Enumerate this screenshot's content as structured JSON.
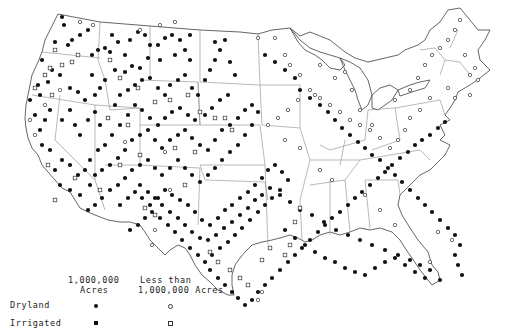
{
  "map": {
    "title": "",
    "region": "Contiguous United States",
    "colors": {
      "outline": "#555555",
      "state_line": "#8a8a8a",
      "marker": "#111111",
      "background": "#ffffff"
    }
  },
  "legend": {
    "col1_header_line1": "1,000,000",
    "col1_header_line2": "Acres",
    "col2_header_line1": "Less than",
    "col2_header_line2": "1,000,000 Acres",
    "rows": [
      {
        "label": "Dryland",
        "large_symbol": "filled-circle",
        "small_symbol": "open-circle"
      },
      {
        "label": "Irrigated",
        "large_symbol": "filled-square",
        "small_symbol": "open-square"
      }
    ]
  },
  "markers": {
    "dryland_large": [
      [
        62,
        17
      ],
      [
        64,
        25
      ],
      [
        80,
        35
      ],
      [
        88,
        30
      ],
      [
        55,
        42
      ],
      [
        68,
        45
      ],
      [
        72,
        40
      ],
      [
        98,
        50
      ],
      [
        105,
        48
      ],
      [
        92,
        55
      ],
      [
        110,
        52
      ],
      [
        118,
        42
      ],
      [
        125,
        55
      ],
      [
        112,
        35
      ],
      [
        130,
        40
      ],
      [
        138,
        32
      ],
      [
        145,
        35
      ],
      [
        150,
        45
      ],
      [
        158,
        45
      ],
      [
        165,
        38
      ],
      [
        172,
        35
      ],
      [
        180,
        40
      ],
      [
        190,
        35
      ],
      [
        185,
        50
      ],
      [
        175,
        55
      ],
      [
        190,
        60
      ],
      [
        160,
        60
      ],
      [
        148,
        58
      ],
      [
        140,
        68
      ],
      [
        132,
        66
      ],
      [
        125,
        72
      ],
      [
        115,
        70
      ],
      [
        105,
        80
      ],
      [
        100,
        88
      ],
      [
        92,
        75
      ],
      [
        95,
        95
      ],
      [
        85,
        100
      ],
      [
        78,
        92
      ],
      [
        70,
        88
      ],
      [
        60,
        75
      ],
      [
        52,
        70
      ],
      [
        48,
        82
      ],
      [
        42,
        60
      ],
      [
        38,
        85
      ],
      [
        40,
        95
      ],
      [
        30,
        100
      ],
      [
        50,
        110
      ],
      [
        45,
        120
      ],
      [
        40,
        130
      ],
      [
        35,
        115
      ],
      [
        42,
        145
      ],
      [
        50,
        150
      ],
      [
        62,
        120
      ],
      [
        70,
        110
      ],
      [
        75,
        125
      ],
      [
        80,
        135
      ],
      [
        88,
        120
      ],
      [
        95,
        112
      ],
      [
        100,
        125
      ],
      [
        108,
        118
      ],
      [
        115,
        105
      ],
      [
        120,
        95
      ],
      [
        128,
        90
      ],
      [
        135,
        85
      ],
      [
        142,
        80
      ],
      [
        150,
        78
      ],
      [
        158,
        88
      ],
      [
        165,
        95
      ],
      [
        170,
        85
      ],
      [
        178,
        80
      ],
      [
        185,
        75
      ],
      [
        192,
        88
      ],
      [
        198,
        95
      ],
      [
        205,
        80
      ],
      [
        210,
        70
      ],
      [
        215,
        60
      ],
      [
        220,
        50
      ],
      [
        225,
        40
      ],
      [
        215,
        42
      ],
      [
        230,
        62
      ],
      [
        235,
        75
      ],
      [
        228,
        95
      ],
      [
        220,
        100
      ],
      [
        212,
        108
      ],
      [
        205,
        115
      ],
      [
        195,
        120
      ],
      [
        188,
        115
      ],
      [
        180,
        108
      ],
      [
        172,
        112
      ],
      [
        165,
        118
      ],
      [
        158,
        125
      ],
      [
        150,
        118
      ],
      [
        142,
        110
      ],
      [
        135,
        105
      ],
      [
        128,
        115
      ],
      [
        120,
        125
      ],
      [
        112,
        135
      ],
      [
        105,
        145
      ],
      [
        98,
        150
      ],
      [
        90,
        160
      ],
      [
        85,
        170
      ],
      [
        78,
        175
      ],
      [
        70,
        165
      ],
      [
        62,
        160
      ],
      [
        55,
        170
      ],
      [
        60,
        185
      ],
      [
        70,
        190
      ],
      [
        80,
        195
      ],
      [
        90,
        185
      ],
      [
        95,
        175
      ],
      [
        102,
        170
      ],
      [
        110,
        165
      ],
      [
        118,
        158
      ],
      [
        125,
        150
      ],
      [
        132,
        140
      ],
      [
        140,
        135
      ],
      [
        148,
        130
      ],
      [
        155,
        140
      ],
      [
        162,
        148
      ],
      [
        170,
        140
      ],
      [
        178,
        135
      ],
      [
        185,
        130
      ],
      [
        192,
        138
      ],
      [
        200,
        145
      ],
      [
        208,
        150
      ],
      [
        215,
        140
      ],
      [
        222,
        130
      ],
      [
        230,
        125
      ],
      [
        238,
        118
      ],
      [
        245,
        110
      ],
      [
        252,
        105
      ],
      [
        258,
        112
      ],
      [
        252,
        125
      ],
      [
        245,
        135
      ],
      [
        238,
        145
      ],
      [
        230,
        152
      ],
      [
        222,
        160
      ],
      [
        215,
        168
      ],
      [
        208,
        175
      ],
      [
        200,
        182
      ],
      [
        192,
        175
      ],
      [
        185,
        168
      ],
      [
        178,
        160
      ],
      [
        170,
        168
      ],
      [
        162,
        175
      ],
      [
        155,
        168
      ],
      [
        148,
        160
      ],
      [
        140,
        165
      ],
      [
        132,
        170
      ],
      [
        125,
        178
      ],
      [
        118,
        185
      ],
      [
        110,
        190
      ],
      [
        102,
        198
      ],
      [
        95,
        205
      ],
      [
        88,
        210
      ],
      [
        120,
        205
      ],
      [
        128,
        198
      ],
      [
        135,
        192
      ],
      [
        142,
        198
      ],
      [
        150,
        205
      ],
      [
        158,
        198
      ],
      [
        165,
        190
      ],
      [
        172,
        195
      ],
      [
        180,
        200
      ],
      [
        188,
        205
      ],
      [
        195,
        212
      ],
      [
        202,
        220
      ],
      [
        210,
        225
      ],
      [
        218,
        218
      ],
      [
        225,
        210
      ],
      [
        232,
        205
      ],
      [
        240,
        198
      ],
      [
        248,
        192
      ],
      [
        255,
        185
      ],
      [
        262,
        178
      ],
      [
        268,
        170
      ],
      [
        275,
        165
      ],
      [
        282,
        172
      ],
      [
        288,
        180
      ],
      [
        280,
        190
      ],
      [
        272,
        198
      ],
      [
        265,
        205
      ],
      [
        258,
        212
      ],
      [
        250,
        220
      ],
      [
        242,
        228
      ],
      [
        235,
        235
      ],
      [
        228,
        242
      ],
      [
        220,
        248
      ],
      [
        212,
        255
      ],
      [
        205,
        262
      ],
      [
        198,
        255
      ],
      [
        190,
        248
      ],
      [
        182,
        240
      ],
      [
        175,
        232
      ],
      [
        168,
        225
      ],
      [
        160,
        218
      ],
      [
        152,
        212
      ],
      [
        145,
        218
      ],
      [
        138,
        225
      ],
      [
        130,
        230
      ],
      [
        210,
        270
      ],
      [
        218,
        278
      ],
      [
        225,
        285
      ],
      [
        232,
        292
      ],
      [
        238,
        298
      ],
      [
        245,
        305
      ],
      [
        252,
        300
      ],
      [
        258,
        292
      ],
      [
        265,
        285
      ],
      [
        272,
        278
      ],
      [
        280,
        270
      ],
      [
        288,
        262
      ],
      [
        295,
        255
      ],
      [
        302,
        248
      ],
      [
        310,
        240
      ],
      [
        318,
        232
      ],
      [
        325,
        225
      ],
      [
        332,
        218
      ],
      [
        340,
        212
      ],
      [
        348,
        205
      ],
      [
        355,
        198
      ],
      [
        362,
        192
      ],
      [
        370,
        185
      ],
      [
        378,
        178
      ],
      [
        385,
        172
      ],
      [
        392,
        165
      ],
      [
        400,
        158
      ],
      [
        408,
        152
      ],
      [
        415,
        145
      ],
      [
        422,
        140
      ],
      [
        430,
        135
      ],
      [
        438,
        128
      ],
      [
        445,
        122
      ],
      [
        265,
        55
      ],
      [
        275,
        62
      ],
      [
        285,
        70
      ],
      [
        295,
        78
      ],
      [
        300,
        90
      ],
      [
        310,
        98
      ],
      [
        320,
        105
      ],
      [
        328,
        112
      ],
      [
        335,
        120
      ],
      [
        342,
        128
      ],
      [
        350,
        135
      ],
      [
        358,
        142
      ],
      [
        365,
        148
      ],
      [
        372,
        155
      ],
      [
        380,
        160
      ],
      [
        388,
        168
      ],
      [
        395,
        175
      ],
      [
        402,
        182
      ],
      [
        410,
        190
      ],
      [
        418,
        198
      ],
      [
        425,
        205
      ],
      [
        432,
        212
      ],
      [
        440,
        220
      ],
      [
        448,
        228
      ],
      [
        455,
        235
      ],
      [
        460,
        245
      ],
      [
        455,
        255
      ],
      [
        458,
        265
      ],
      [
        462,
        275
      ],
      [
        440,
        280
      ],
      [
        430,
        270
      ],
      [
        420,
        265
      ],
      [
        410,
        260
      ],
      [
        398,
        255
      ],
      [
        385,
        250
      ],
      [
        372,
        245
      ],
      [
        360,
        240
      ],
      [
        348,
        235
      ],
      [
        336,
        230
      ],
      [
        324,
        222
      ],
      [
        312,
        215
      ],
      [
        300,
        210
      ],
      [
        290,
        202
      ],
      [
        280,
        195
      ],
      [
        270,
        188
      ],
      [
        262,
        195
      ],
      [
        255,
        200
      ],
      [
        248,
        208
      ],
      [
        240,
        215
      ],
      [
        232,
        222
      ],
      [
        224,
        228
      ],
      [
        216,
        235
      ],
      [
        208,
        240
      ],
      [
        200,
        238
      ],
      [
        192,
        232
      ],
      [
        185,
        225
      ],
      [
        178,
        218
      ],
      [
        170,
        212
      ],
      [
        162,
        205
      ],
      [
        155,
        198
      ],
      [
        148,
        192
      ],
      [
        140,
        185
      ],
      [
        285,
        230
      ],
      [
        295,
        238
      ],
      [
        305,
        245
      ],
      [
        315,
        252
      ],
      [
        325,
        258
      ],
      [
        335,
        262
      ],
      [
        345,
        268
      ],
      [
        355,
        272
      ],
      [
        365,
        275
      ],
      [
        375,
        268
      ],
      [
        385,
        262
      ],
      [
        395,
        258
      ],
      [
        405,
        265
      ],
      [
        415,
        272
      ],
      [
        425,
        278
      ]
    ],
    "dryland_small": [
      [
        80,
        22
      ],
      [
        93,
        25
      ],
      [
        140,
        30
      ],
      [
        160,
        25
      ],
      [
        175,
        22
      ],
      [
        60,
        90
      ],
      [
        45,
        105
      ],
      [
        30,
        120
      ],
      [
        35,
        135
      ],
      [
        125,
        142
      ],
      [
        165,
        152
      ],
      [
        258,
        38
      ],
      [
        275,
        38
      ],
      [
        285,
        55
      ],
      [
        290,
        65
      ],
      [
        300,
        75
      ],
      [
        320,
        65
      ],
      [
        335,
        78
      ],
      [
        345,
        72
      ],
      [
        352,
        90
      ],
      [
        360,
        110
      ],
      [
        372,
        125
      ],
      [
        395,
        100
      ],
      [
        410,
        90
      ],
      [
        418,
        78
      ],
      [
        425,
        65
      ],
      [
        432,
        55
      ],
      [
        440,
        48
      ],
      [
        448,
        40
      ],
      [
        455,
        30
      ],
      [
        460,
        20
      ],
      [
        465,
        55
      ],
      [
        470,
        75
      ],
      [
        475,
        68
      ],
      [
        478,
        80
      ],
      [
        470,
        95
      ],
      [
        455,
        98
      ],
      [
        448,
        88
      ],
      [
        430,
        98
      ],
      [
        420,
        110
      ],
      [
        410,
        118
      ],
      [
        405,
        130
      ],
      [
        398,
        140
      ],
      [
        390,
        148
      ],
      [
        380,
        138
      ],
      [
        370,
        130
      ],
      [
        360,
        125
      ],
      [
        350,
        120
      ],
      [
        340,
        112
      ],
      [
        330,
        105
      ],
      [
        320,
        98
      ],
      [
        310,
        90
      ],
      [
        298,
        100
      ],
      [
        288,
        110
      ],
      [
        278,
        118
      ],
      [
        268,
        125
      ],
      [
        285,
        140
      ],
      [
        300,
        148
      ],
      [
        320,
        170
      ],
      [
        332,
        180
      ],
      [
        365,
        195
      ],
      [
        380,
        210
      ],
      [
        395,
        225
      ],
      [
        430,
        262
      ],
      [
        438,
        232
      ],
      [
        452,
        240
      ],
      [
        315,
        95
      ],
      [
        258,
        300
      ],
      [
        262,
        292
      ],
      [
        170,
        190
      ],
      [
        155,
        230
      ],
      [
        152,
        245
      ]
    ],
    "irrigated_large": [],
    "irrigated_small": [
      [
        55,
        50
      ],
      [
        78,
        55
      ],
      [
        72,
        62
      ],
      [
        62,
        65
      ],
      [
        50,
        68
      ],
      [
        45,
        75
      ],
      [
        35,
        88
      ],
      [
        52,
        95
      ],
      [
        110,
        60
      ],
      [
        120,
        78
      ],
      [
        138,
        88
      ],
      [
        155,
        102
      ],
      [
        170,
        100
      ],
      [
        188,
        95
      ],
      [
        200,
        112
      ],
      [
        215,
        118
      ],
      [
        225,
        118
      ],
      [
        232,
        130
      ],
      [
        140,
        155
      ],
      [
        120,
        165
      ],
      [
        100,
        190
      ],
      [
        145,
        208
      ],
      [
        155,
        215
      ],
      [
        210,
        252
      ],
      [
        218,
        262
      ],
      [
        230,
        270
      ],
      [
        240,
        278
      ],
      [
        248,
        285
      ],
      [
        262,
        260
      ],
      [
        270,
        248
      ],
      [
        285,
        255
      ],
      [
        290,
        245
      ],
      [
        295,
        222
      ],
      [
        300,
        208
      ],
      [
        185,
        185
      ],
      [
        175,
        148
      ],
      [
        195,
        152
      ],
      [
        48,
        165
      ],
      [
        55,
        200
      ],
      [
        75,
        178
      ],
      [
        108,
        118
      ],
      [
        128,
        125
      ]
    ]
  }
}
